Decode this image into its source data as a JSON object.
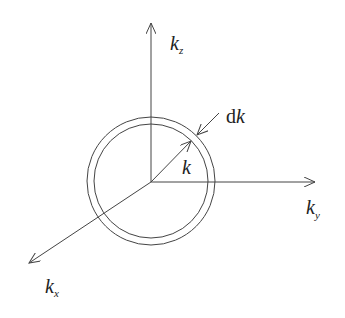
{
  "diagram": {
    "title": "",
    "axes": [
      {
        "id": "kz",
        "symbol": "k",
        "subscript": "z",
        "direction": "up"
      },
      {
        "id": "ky",
        "symbol": "k",
        "subscript": "y",
        "direction": "right"
      },
      {
        "id": "kx",
        "symbol": "k",
        "subscript": "x",
        "direction": "down-left"
      }
    ],
    "radius_label": {
      "symbol": "k"
    },
    "shell_label": {
      "prefix": "d",
      "symbol": "k"
    },
    "colors": {
      "stroke": "#444444",
      "text": "#222222",
      "background": "#ffffff"
    }
  }
}
